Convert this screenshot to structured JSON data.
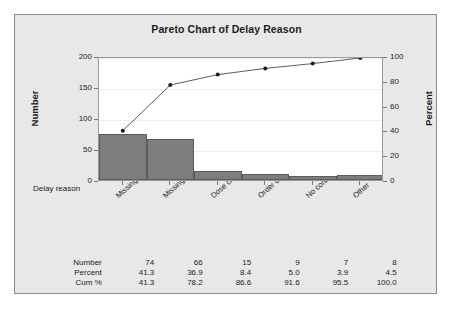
{
  "chart_data": {
    "type": "bar",
    "title": "Pareto Chart of Delay Reason",
    "xlabel": "Delay reason",
    "ylabel": "Number",
    "ylabel_right": "Percent",
    "categories": [
      "Missing D.O.S.",
      "Missing height and weight",
      "Dose change",
      "Order clarification",
      "No consent form",
      "Other"
    ],
    "values": [
      74,
      66,
      15,
      9,
      7,
      8
    ],
    "percent": [
      41.3,
      36.9,
      8.4,
      5.0,
      3.9,
      4.5
    ],
    "cumulative_percent": [
      41.3,
      78.2,
      86.6,
      91.6,
      95.5,
      100.0
    ],
    "ylim": [
      0,
      200
    ],
    "ylim_right": [
      0,
      100
    ],
    "yticks": [
      0,
      50,
      100,
      150,
      200
    ],
    "yticks_right": [
      0,
      20,
      40,
      60,
      80,
      100
    ],
    "grid": true,
    "legend": "none",
    "total": 179,
    "bar_color": "#7d7d7d",
    "line_color": "#4a4a4a",
    "plot_background": "#ffffff",
    "figure_background": "#e8e8e8"
  },
  "table": {
    "rows": [
      {
        "label": "Number",
        "values": [
          "74",
          "66",
          "15",
          "9",
          "7",
          "8"
        ]
      },
      {
        "label": "Percent",
        "values": [
          "41.3",
          "36.9",
          "8.4",
          "5.0",
          "3.9",
          "4.5"
        ]
      },
      {
        "label": "Cum %",
        "values": [
          "41.3",
          "78.2",
          "86.6",
          "91.6",
          "95.5",
          "100.0"
        ]
      }
    ]
  }
}
